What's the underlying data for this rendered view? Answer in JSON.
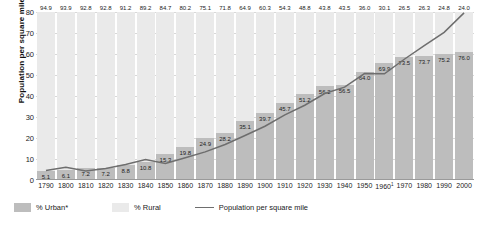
{
  "chart_data": {
    "type": "bar",
    "title": "",
    "xlabel": "",
    "ylabel": "Population per square mile",
    "ylim": [
      0,
      80
    ],
    "yticks": [
      0,
      10,
      20,
      30,
      40,
      50,
      60,
      70,
      80
    ],
    "grid": true,
    "legend_position": "bottom-left",
    "categories": [
      "1790",
      "1800",
      "1810",
      "1820",
      "1830",
      "1840",
      "1850",
      "1860",
      "1870",
      "1880",
      "1890",
      "1900",
      "1910",
      "1920",
      "1930",
      "1940",
      "1950",
      "1960",
      "1970",
      "1980",
      "1990",
      "2000"
    ],
    "category_footnotes": {
      "1960": "1"
    },
    "series": [
      {
        "name": "% Urban*",
        "type": "bar",
        "color": "#bdbdbd",
        "values": [
          5.1,
          6.1,
          7.2,
          7.2,
          8.8,
          10.8,
          15.3,
          19.8,
          24.9,
          28.2,
          35.1,
          39.7,
          45.7,
          51.2,
          56.2,
          56.5,
          64.0,
          69.9,
          73.5,
          73.7,
          75.2,
          76.0
        ]
      },
      {
        "name": "% Rural",
        "type": "bar",
        "color": "#eaeaea",
        "values": [
          94.9,
          93.9,
          92.8,
          92.8,
          91.2,
          89.2,
          84.7,
          80.2,
          75.1,
          71.8,
          64.9,
          60.3,
          54.3,
          48.8,
          43.8,
          43.5,
          36.0,
          30.1,
          26.5,
          26.3,
          24.8,
          24.0
        ]
      },
      {
        "name": "Population per square mile",
        "type": "line",
        "color": "#6e6e6e",
        "values": [
          4.5,
          6.1,
          4.3,
          5.5,
          7.4,
          9.8,
          7.9,
          10.6,
          13.4,
          16.9,
          21.2,
          25.6,
          31.0,
          35.6,
          41.2,
          44.2,
          50.7,
          50.6,
          57.5,
          64.0,
          70.3,
          79.6
        ]
      }
    ]
  },
  "legend": {
    "urban_label": "% Urban*",
    "rural_label": "% Rural",
    "line_label": "Population per square mile"
  }
}
